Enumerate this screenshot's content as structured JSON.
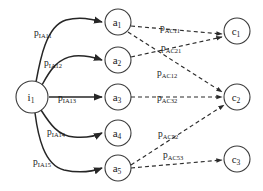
{
  "diagram": {
    "type": "bipartite-flow-graph",
    "background_color": "#ffffff",
    "stroke_color": "#2b2b2b",
    "nodes": {
      "input": [
        {
          "id": "i1",
          "base": "i",
          "sub": "1",
          "cx": 32,
          "cy": 97,
          "r": 16
        }
      ],
      "middle": [
        {
          "id": "a1",
          "base": "a",
          "sub": "1",
          "cx": 118,
          "cy": 22,
          "r": 13
        },
        {
          "id": "a2",
          "base": "a",
          "sub": "2",
          "cx": 118,
          "cy": 60,
          "r": 13
        },
        {
          "id": "a3",
          "base": "a",
          "sub": "3",
          "cx": 118,
          "cy": 97,
          "r": 13
        },
        {
          "id": "a4",
          "base": "a",
          "sub": "4",
          "cx": 118,
          "cy": 133,
          "r": 13
        },
        {
          "id": "a5",
          "base": "a",
          "sub": "5",
          "cx": 118,
          "cy": 168,
          "r": 13
        }
      ],
      "output": [
        {
          "id": "c1",
          "base": "c",
          "sub": "1",
          "cx": 237,
          "cy": 31,
          "r": 13
        },
        {
          "id": "c2",
          "base": "c",
          "sub": "2",
          "cx": 237,
          "cy": 97,
          "r": 13
        },
        {
          "id": "c3",
          "base": "c",
          "sub": "3",
          "cx": 237,
          "cy": 159,
          "r": 13
        }
      ]
    },
    "solid_edges": [
      {
        "id": "i1-a1",
        "from": "i1",
        "to": "a1",
        "label_base": "p",
        "label_sub": "IA11",
        "label_x": 34,
        "label_y": 36,
        "path": "M 36 82 C 40 60 46 26 66 20 C 82 16 94 20 102 22"
      },
      {
        "id": "i1-a2",
        "from": "i1",
        "to": "a2",
        "label_base": "p",
        "label_sub": "IA12",
        "label_x": 44,
        "label_y": 66,
        "path": "M 42 85 C 50 70 58 58 74 56 C 88 55 96 58 102 60"
      },
      {
        "id": "i1-a3",
        "from": "i1",
        "to": "a3",
        "label_base": "p",
        "label_sub": "IA13",
        "label_x": 58,
        "label_y": 101,
        "path": "M 49 97 L 102 97"
      },
      {
        "id": "i1-a4",
        "from": "i1",
        "to": "a4",
        "label_base": "p",
        "label_sub": "IA14",
        "label_x": 47,
        "label_y": 135,
        "path": "M 41 110 C 50 124 58 136 74 137 C 88 138 96 136 102 133"
      },
      {
        "id": "i1-a5",
        "from": "i1",
        "to": "a5",
        "label_base": "p",
        "label_sub": "IA15",
        "label_x": 33,
        "label_y": 165,
        "path": "M 35 113 C 38 136 44 165 64 170 C 82 174 94 171 102 168"
      }
    ],
    "dashed_edges": [
      {
        "id": "a1-c1",
        "from": "a1",
        "to": "c1",
        "label_base": "p",
        "label_sub": "AC11",
        "label_x": 160,
        "label_y": 31,
        "path": "M 131 26 L 222 34"
      },
      {
        "id": "a1-c2",
        "from": "a1",
        "to": "c2",
        "label_base": "p",
        "label_sub": "AC12",
        "label_x": 157,
        "label_y": 76,
        "path": "M 128 32 L 222 92"
      },
      {
        "id": "a2-c1",
        "from": "a2",
        "to": "c1",
        "label_base": "p",
        "label_sub": "AC21",
        "label_x": 161,
        "label_y": 51,
        "path": "M 131 57 L 222 37"
      },
      {
        "id": "a3-c2",
        "from": "a3",
        "to": "c2",
        "label_base": "p",
        "label_sub": "AC32",
        "label_x": 157,
        "label_y": 101,
        "path": "M 131 97 L 222 97"
      },
      {
        "id": "a5-c2",
        "from": "a5",
        "to": "c2",
        "label_base": "p",
        "label_sub": "AC52",
        "label_x": 158,
        "label_y": 137,
        "path": "M 131 165 L 224 105"
      },
      {
        "id": "a5-c3",
        "from": "a5",
        "to": "c3",
        "label_base": "p",
        "label_sub": "AC53",
        "label_x": 163,
        "label_y": 158,
        "path": "M 131 168 L 222 160"
      }
    ]
  }
}
